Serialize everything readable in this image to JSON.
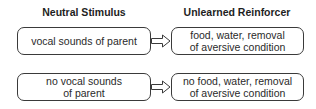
{
  "headers": {
    "left": "Neutral Stimulus",
    "right": "Unlearned Reinforcer"
  },
  "rows": [
    {
      "stimulus": "vocal sounds of parent",
      "reinforcer": "food, water, removal\nof aversive condition",
      "arrow": "hollow-right-arrow"
    },
    {
      "stimulus": "no vocal sounds\nof parent",
      "reinforcer": "no food, water, removal\nof aversive condition",
      "arrow": "hollow-right-arrow"
    }
  ],
  "colors": {
    "stroke": "#3a3a3a",
    "text": "#2a2a2a",
    "background": "#ffffff"
  }
}
